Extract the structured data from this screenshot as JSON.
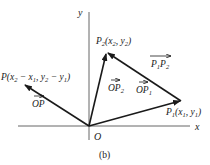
{
  "diagram": {
    "caption": "(b)",
    "axes": {
      "x_label": "x",
      "y_label": "y",
      "origin_label": "O"
    },
    "points": {
      "P1": {
        "name": "P",
        "sub": "1",
        "coords": "(x",
        "c1sub": "1",
        "sep": ", y",
        "c2sub": "1",
        "close": ")"
      },
      "P2": {
        "name": "P",
        "sub": "2",
        "coords": "(x",
        "c1sub": "2",
        "sep": ", y",
        "c2sub": "2",
        "close": ")"
      },
      "P": {
        "name": "P",
        "a": "(x",
        "a_sub": "2",
        "b": " − x",
        "b_sub": "1",
        "c": ", y",
        "c_sub": "2",
        "d": " − y",
        "d_sub": "1",
        "close": ")"
      }
    },
    "vectors": {
      "OP": {
        "label": "OP",
        "sub": ""
      },
      "OP1": {
        "label": "OP",
        "sub": "1"
      },
      "OP2": {
        "label": "OP",
        "sub": "2"
      },
      "P1P2": {
        "a": "P",
        "a_sub": "1",
        "b": "P",
        "b_sub": "2"
      }
    },
    "colors": {
      "stroke": "#1a1a1a",
      "axis": "#555555"
    }
  }
}
